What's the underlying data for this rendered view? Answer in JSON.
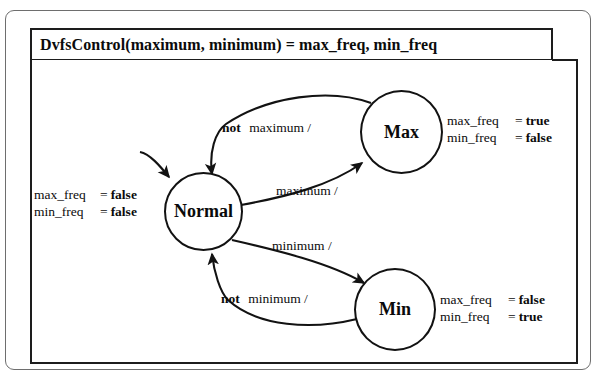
{
  "diagram": {
    "title": "DvfsControl(maximum, minimum) = max_freq, min_freq",
    "states": [
      {
        "id": "normal",
        "label": "Normal"
      },
      {
        "id": "max",
        "label": "Max"
      },
      {
        "id": "min",
        "label": "Min"
      }
    ],
    "annotations": {
      "normal": {
        "line1": {
          "var": "max_freq",
          "eq": "=",
          "val": "false"
        },
        "line2": {
          "var": "min_freq",
          "eq": "=",
          "val": "false"
        }
      },
      "max": {
        "line1": {
          "var": "max_freq",
          "eq": "=",
          "val": "true"
        },
        "line2": {
          "var": "min_freq",
          "eq": "=",
          "val": "false"
        }
      },
      "min": {
        "line1": {
          "var": "max_freq",
          "eq": "=",
          "val": "false"
        },
        "line2": {
          "var": "min_freq",
          "eq": "=",
          "val": "true"
        }
      }
    },
    "transitions": [
      {
        "id": "max-to-normal",
        "keyword": "not",
        "guard": "maximum /"
      },
      {
        "id": "normal-to-max",
        "keyword": "",
        "guard": "maximum /"
      },
      {
        "id": "normal-to-min",
        "keyword": "",
        "guard": "minimum /"
      },
      {
        "id": "min-to-normal",
        "keyword": "not",
        "guard": "minimum /"
      }
    ],
    "initial_transition": "initial-arrow",
    "colors": {
      "stroke": "#121212",
      "frame": "#1d1d1d",
      "outer_frame": "#6e6e6e",
      "background": "#ffffff",
      "text": "#0b0b0b"
    }
  }
}
